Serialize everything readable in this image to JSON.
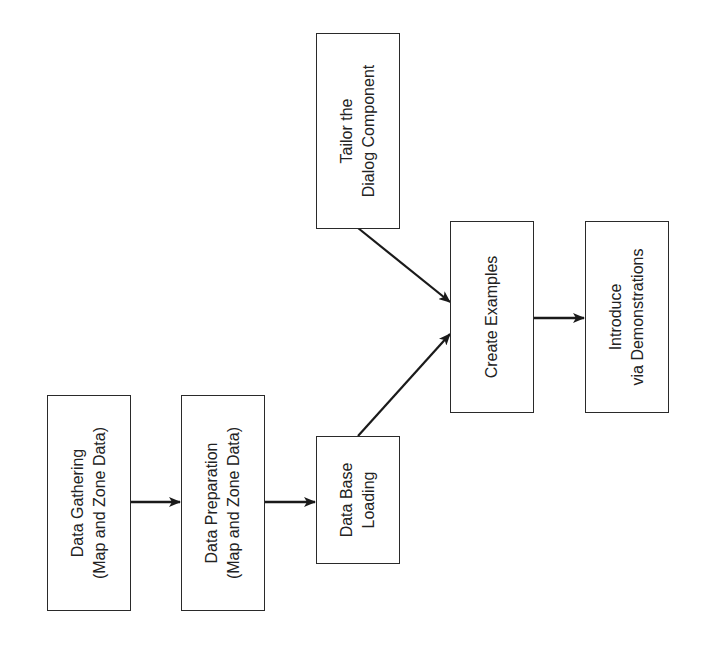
{
  "diagram": {
    "type": "flowchart",
    "orientation": "rotated-90-ccw",
    "colors": {
      "line": "#1a1a1a",
      "box_border": "#2a2a2a",
      "text": "#222222",
      "background": "#ffffff"
    },
    "nodes": [
      {
        "id": "gathering",
        "lines": [
          "Data Gathering",
          "(Map and Zone Data)"
        ]
      },
      {
        "id": "preparation",
        "lines": [
          "Data Preparation",
          "(Map and Zone Data)"
        ]
      },
      {
        "id": "loading",
        "lines": [
          "Data Base",
          "Loading"
        ]
      },
      {
        "id": "tailor",
        "lines": [
          "Tailor the",
          "Dialog Component"
        ]
      },
      {
        "id": "examples",
        "lines": [
          "Create Examples"
        ]
      },
      {
        "id": "introduce",
        "lines": [
          "Introduce",
          "via Demonstrations"
        ]
      }
    ],
    "edges": [
      {
        "from": "gathering",
        "to": "preparation"
      },
      {
        "from": "preparation",
        "to": "loading"
      },
      {
        "from": "loading",
        "to": "examples"
      },
      {
        "from": "tailor",
        "to": "examples"
      },
      {
        "from": "examples",
        "to": "introduce"
      }
    ]
  }
}
